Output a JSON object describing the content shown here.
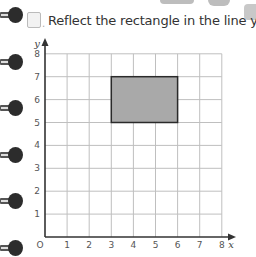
{
  "question": {
    "label": "A",
    "text": "Reflect the rectangle in the line y = 4"
  },
  "binder_rings": [
    15,
    62,
    108,
    155,
    201,
    248
  ],
  "colors": {
    "grid": "#bfbfbf",
    "axis": "#333333",
    "rectangle_fill": "#a9a9a9",
    "rectangle_stroke": "#2a2a2a"
  },
  "chart_data": {
    "type": "grid",
    "title": "Reflect the rectangle in the line y = 4",
    "xlabel": "x",
    "ylabel": "y",
    "origin_label": "O",
    "x_ticks": [
      "1",
      "2",
      "3",
      "4",
      "5",
      "6",
      "7",
      "8"
    ],
    "y_ticks": [
      "1",
      "2",
      "3",
      "4",
      "5",
      "6",
      "7",
      "8"
    ],
    "xlim": [
      0,
      8
    ],
    "ylim": [
      0,
      8
    ],
    "grid": true,
    "shapes": [
      {
        "type": "rectangle",
        "x_min": 3,
        "x_max": 6,
        "y_min": 5,
        "y_max": 7,
        "fill": "#a9a9a9"
      }
    ],
    "mirror_line": "y = 4"
  }
}
